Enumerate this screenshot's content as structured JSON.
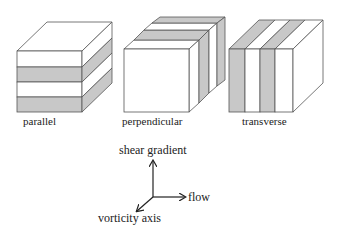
{
  "diagram": {
    "cubes": [
      {
        "id": "parallel",
        "label": "parallel",
        "stripe_orientation": "horizontal"
      },
      {
        "id": "perpendicular",
        "label": "perpendicular",
        "stripe_orientation": "depth"
      },
      {
        "id": "transverse",
        "label": "transverse",
        "stripe_orientation": "vertical"
      }
    ],
    "axes": {
      "up": "shear gradient",
      "right": "flow",
      "diagonal": "vorticity axis"
    },
    "colors": {
      "stripe_gray": "#c8c8c8",
      "edge": "#444444",
      "face": "#ffffff"
    }
  }
}
